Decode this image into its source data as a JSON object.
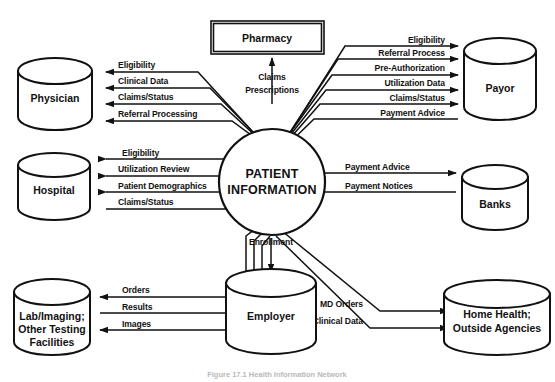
{
  "diagram": {
    "center_node": {
      "name": "center-process",
      "line1": "PATIENT",
      "line2": "INFORMATION"
    },
    "nodes": [
      {
        "id": "physician",
        "shape": "cylinder",
        "lines": [
          "Physician"
        ]
      },
      {
        "id": "hospital",
        "shape": "cylinder",
        "lines": [
          "Hospital"
        ]
      },
      {
        "id": "lab",
        "shape": "cylinder",
        "lines": [
          "Lab/Imaging;",
          "Other Testing",
          "Facilities"
        ]
      },
      {
        "id": "pharmacy",
        "shape": "box",
        "lines": [
          "Pharmacy"
        ]
      },
      {
        "id": "employer",
        "shape": "cylinder",
        "lines": [
          "Employer"
        ]
      },
      {
        "id": "payor",
        "shape": "cylinder",
        "lines": [
          "Payor"
        ]
      },
      {
        "id": "banks",
        "shape": "cylinder",
        "lines": [
          "Banks"
        ]
      },
      {
        "id": "homehealth",
        "shape": "cylinder",
        "lines": [
          "Home Health;",
          "Outside Agencies"
        ]
      }
    ],
    "flows": {
      "physician": [
        "Eligibility",
        "Clinical Data",
        "Claims/Status",
        "Referral Processing"
      ],
      "hospital": [
        "Eligibility",
        "Utilization Review",
        "Patient Demographics",
        "Claims/Status"
      ],
      "lab": [
        "Orders",
        "Results",
        "Images"
      ],
      "pharmacy": [
        "Claims",
        "Prescriptions"
      ],
      "employer": [
        "Enrollment"
      ],
      "payor": [
        "Eligibility",
        "Referral Process",
        "Pre-Authorization",
        "Utilization Data",
        "Claims/Status",
        "Payment Advice"
      ],
      "banks": [
        "Payment Advice",
        "Payment Notices"
      ],
      "homehealth": [
        "MD Orders",
        "Clinical Data"
      ]
    },
    "caption": "Figure 17.1  Health Information Network",
    "colors": {
      "stroke": "#111111",
      "fill": "#ffffff",
      "caption": "#b9b9b9"
    }
  }
}
